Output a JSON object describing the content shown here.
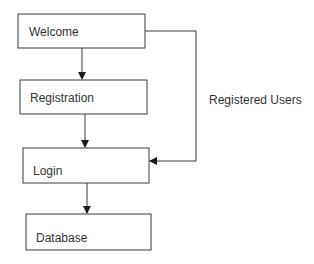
{
  "diagram": {
    "type": "flowchart",
    "colors": {
      "stroke": "#3a3a3a",
      "text": "#333333",
      "background": "#ffffff"
    },
    "nodes": [
      {
        "id": "welcome",
        "label": "Welcome",
        "x": 18,
        "y": 14,
        "w": 127,
        "h": 34
      },
      {
        "id": "registration",
        "label": "Registration",
        "x": 20,
        "y": 80,
        "w": 127,
        "h": 34
      },
      {
        "id": "login",
        "label": "Login",
        "x": 23,
        "y": 148,
        "w": 126,
        "h": 35
      },
      {
        "id": "database",
        "label": "Database",
        "x": 26,
        "y": 214,
        "w": 125,
        "h": 36
      }
    ],
    "edges": [
      {
        "from": "welcome",
        "to": "registration",
        "label": ""
      },
      {
        "from": "registration",
        "to": "login",
        "label": ""
      },
      {
        "from": "welcome",
        "to": "login",
        "label": "Registered Users"
      },
      {
        "from": "login",
        "to": "database",
        "label": ""
      }
    ],
    "edge_labels": {
      "registered_users": "Registered Users"
    }
  }
}
